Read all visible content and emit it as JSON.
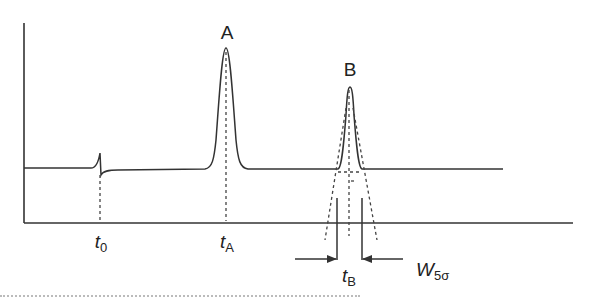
{
  "diagram": {
    "peaks": [
      {
        "label": "A",
        "retention_label": "t",
        "retention_sub": "A"
      },
      {
        "label": "B",
        "retention_label": "t",
        "retention_sub": "B"
      }
    ],
    "dead_time": {
      "label": "t",
      "sub": "0"
    },
    "width_label": {
      "label": "W",
      "sub": "5σ"
    },
    "colors": {
      "line": "#333333",
      "dashed": "#444444",
      "background": "#ffffff"
    }
  }
}
